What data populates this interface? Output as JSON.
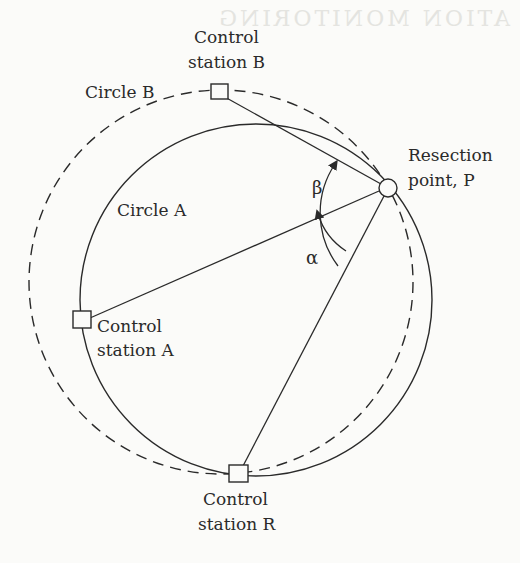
{
  "figure": {
    "bleed_through_text": "ATION MONITORING",
    "colors": {
      "ink": "#2a2a2a",
      "paper": "#fbfbf9",
      "ghost": "#e4e4e0"
    },
    "circles": [
      {
        "id": "circle-a",
        "label": "Circle A",
        "style": "solid"
      },
      {
        "id": "circle-b",
        "label": "Circle B",
        "style": "dashed"
      }
    ],
    "stations": {
      "A": {
        "label_line1": "Control",
        "label_line2": "station A",
        "marker": "square"
      },
      "B": {
        "label_line1": "Control",
        "label_line2": "station B",
        "marker": "square"
      },
      "R": {
        "label_line1": "Control",
        "label_line2": "station R",
        "marker": "square"
      }
    },
    "resection_point": {
      "label_line1": "Resection",
      "label_line2": "point, P",
      "marker": "circle"
    },
    "angles": {
      "alpha": {
        "symbol": "α",
        "between": [
          "P-A",
          "P-R"
        ]
      },
      "beta": {
        "symbol": "β",
        "between": [
          "P-B",
          "P-R"
        ]
      }
    }
  }
}
